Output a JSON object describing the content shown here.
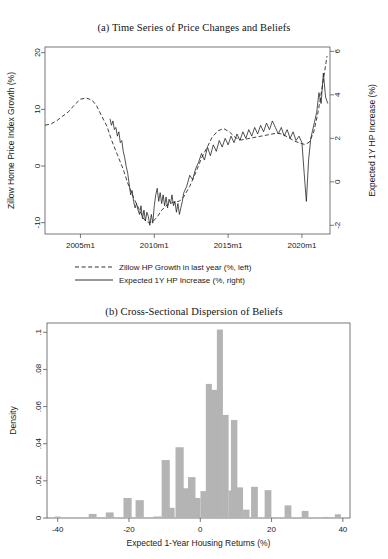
{
  "figure": {
    "background": "#ffffff",
    "panels": [
      "panel-a",
      "panel-b"
    ]
  },
  "panel_a": {
    "title_prefix": "(a)",
    "title": "(a) Time Series of Price Changes and Beliefs",
    "title_text": "Time Series of Price Changes and Beliefs",
    "left_axis_label": "Zillow Home Price Index Growth (%)",
    "right_axis_label": "Expected 1Y HP Increase (%)",
    "left_ticks": [
      "20",
      "10",
      "0",
      "-10"
    ],
    "right_ticks": [
      "6",
      "4",
      "2",
      "0",
      "-2"
    ],
    "x_ticks": [
      "2005m1",
      "2010m1",
      "2015m1",
      "2020m1"
    ],
    "legend": [
      {
        "label": "Zillow HP Growth in last year (%, left)",
        "style": "dashed"
      },
      {
        "label": "Expected 1Y HP Increase (%, right)",
        "style": "solid"
      }
    ]
  },
  "panel_b": {
    "title_prefix": "(b)",
    "title": "(b) Cross-Sectional Dispersion of Beliefs",
    "title_text": "Cross-Sectional Dispersion of Beliefs",
    "y_axis_label": "Density",
    "x_axis_label": "Expected 1-Year Housing Returns (%)",
    "y_ticks": [
      ".1",
      ".08",
      ".06",
      ".04",
      ".02",
      "0"
    ],
    "x_ticks": [
      "-40",
      "-20",
      "0",
      "20",
      "40"
    ]
  },
  "colors": {
    "bar_fill": "#b4b4b4",
    "axis": "#555555",
    "line": "#1a1a1a",
    "text": "#1a1a1a",
    "background": "#ffffff"
  },
  "chart_data": [
    {
      "id": "panel-a",
      "type": "line",
      "title": "(a) Time Series of Price Changes and Beliefs",
      "xlabel": "",
      "ylabel": "Zillow Home Price Index Growth (%)",
      "y2label": "Expected 1Y HP Increase (%)",
      "xlim": [
        2002.6,
        2021.9
      ],
      "ylim": [
        -12.0,
        21.0
      ],
      "y2lim": [
        -2.4,
        6.2
      ],
      "yticks": [
        20,
        10,
        0,
        -10
      ],
      "y2ticks": [
        6,
        4,
        2,
        0,
        -2
      ],
      "xticks": [
        2005,
        2010,
        2015,
        2020
      ],
      "xticklabels": [
        "2005m1",
        "2010m1",
        "2015m1",
        "2020m1"
      ],
      "grid": false,
      "legend_position": "below",
      "series": [
        {
          "name": "Zillow HP Growth in last year (%, left)",
          "style": "dashed",
          "axis": "left",
          "x": [
            2002.6,
            2003.0,
            2003.4,
            2003.8,
            2004.2,
            2004.6,
            2005.0,
            2005.4,
            2005.8,
            2006.1,
            2006.4,
            2006.8,
            2007.1,
            2007.5,
            2007.9,
            2008.2,
            2008.6,
            2009.0,
            2009.3,
            2009.6,
            2009.9,
            2010.2,
            2010.5,
            2010.9,
            2011.3,
            2011.7,
            2012.0,
            2012.4,
            2012.8,
            2013.2,
            2013.6,
            2013.9,
            2014.3,
            2014.7,
            2015.1,
            2015.5,
            2015.9,
            2016.3,
            2016.7,
            2017.1,
            2017.5,
            2017.9,
            2018.3,
            2018.7,
            2019.1,
            2019.5,
            2019.9,
            2020.2,
            2020.5,
            2020.8,
            2021.1,
            2021.4,
            2021.7
          ],
          "y": [
            7.2,
            7.4,
            8.0,
            8.8,
            9.6,
            10.8,
            11.8,
            12.0,
            11.6,
            10.6,
            9.0,
            7.0,
            4.6,
            2.0,
            -0.6,
            -3.0,
            -5.6,
            -7.8,
            -9.4,
            -10.0,
            -9.8,
            -9.0,
            -7.8,
            -6.8,
            -6.4,
            -6.2,
            -5.4,
            -3.6,
            -1.2,
            1.4,
            3.4,
            5.0,
            6.2,
            6.6,
            6.0,
            5.0,
            4.6,
            4.8,
            5.0,
            5.2,
            5.4,
            5.6,
            5.8,
            5.6,
            5.0,
            4.4,
            4.0,
            3.8,
            4.2,
            6.0,
            9.6,
            14.4,
            19.4
          ]
        },
        {
          "name": "Expected 1Y HP Increase (%, right)",
          "style": "solid",
          "axis": "right",
          "x": [
            2007.0,
            2007.1,
            2007.2,
            2007.3,
            2007.4,
            2007.5,
            2007.6,
            2007.7,
            2007.8,
            2007.9,
            2008.0,
            2008.1,
            2008.2,
            2008.3,
            2008.4,
            2008.5,
            2008.6,
            2008.7,
            2008.8,
            2008.9,
            2009.0,
            2009.1,
            2009.2,
            2009.3,
            2009.4,
            2009.5,
            2009.6,
            2009.7,
            2009.8,
            2009.9,
            2010.0,
            2010.1,
            2010.2,
            2010.3,
            2010.4,
            2010.5,
            2010.6,
            2010.7,
            2010.8,
            2010.9,
            2011.0,
            2011.1,
            2011.2,
            2011.3,
            2011.4,
            2011.5,
            2011.6,
            2011.7,
            2011.8,
            2011.9,
            2012.0,
            2012.2,
            2012.4,
            2012.6,
            2012.8,
            2013.0,
            2013.2,
            2013.4,
            2013.6,
            2013.8,
            2014.0,
            2014.2,
            2014.4,
            2014.6,
            2014.8,
            2015.0,
            2015.2,
            2015.4,
            2015.6,
            2015.8,
            2016.0,
            2016.2,
            2016.4,
            2016.6,
            2016.8,
            2017.0,
            2017.2,
            2017.4,
            2017.6,
            2017.8,
            2018.0,
            2018.2,
            2018.4,
            2018.6,
            2018.8,
            2019.0,
            2019.2,
            2019.4,
            2019.6,
            2019.8,
            2020.0,
            2020.15,
            2020.3,
            2020.45,
            2020.6,
            2020.8,
            2021.0,
            2021.15,
            2021.3,
            2021.45,
            2021.6,
            2021.75
          ],
          "y": [
            2.9,
            2.6,
            2.8,
            2.4,
            2.5,
            2.1,
            2.3,
            1.8,
            1.9,
            1.4,
            1.1,
            0.7,
            0.4,
            -0.1,
            -0.6,
            -0.4,
            -0.9,
            -1.2,
            -1.0,
            -1.3,
            -1.5,
            -1.1,
            -1.7,
            -1.3,
            -1.8,
            -1.4,
            -1.6,
            -2.0,
            -1.5,
            -1.9,
            -1.1,
            -0.6,
            -0.3,
            -0.9,
            -0.5,
            -1.0,
            -0.6,
            -1.1,
            -0.7,
            -1.2,
            -0.8,
            -1.0,
            -0.6,
            -1.1,
            -0.9,
            -1.4,
            -1.0,
            -1.5,
            -1.2,
            -0.9,
            -0.5,
            -0.2,
            0.3,
            0.1,
            0.6,
            0.9,
            1.3,
            1.0,
            1.6,
            1.2,
            1.7,
            1.4,
            1.9,
            1.6,
            2.0,
            1.7,
            2.1,
            1.8,
            2.2,
            1.9,
            2.3,
            2.0,
            2.4,
            2.1,
            2.5,
            2.2,
            2.6,
            2.3,
            2.7,
            2.4,
            2.8,
            2.5,
            2.2,
            2.5,
            2.1,
            2.4,
            2.0,
            2.3,
            1.9,
            2.1,
            1.8,
            0.4,
            -0.9,
            1.0,
            2.0,
            2.6,
            3.2,
            4.1,
            3.6,
            5.0,
            3.9,
            3.6
          ]
        }
      ]
    },
    {
      "id": "panel-b",
      "type": "bar",
      "subtype": "histogram",
      "title": "(b) Cross-Sectional Dispersion of Beliefs",
      "xlabel": "Expected 1-Year Housing Returns (%)",
      "ylabel": "Density",
      "xlim": [
        -43,
        42
      ],
      "ylim": [
        0,
        0.105
      ],
      "xticks": [
        -40,
        -20,
        0,
        20,
        40
      ],
      "yticks": [
        0,
        0.02,
        0.04,
        0.06,
        0.08,
        0.1
      ],
      "yticklabels": [
        "0",
        ".02",
        ".04",
        ".06",
        ".08",
        ".1"
      ],
      "grid": false,
      "bin_width": 2.5,
      "bin_centers": [
        -40,
        -30,
        -25,
        -20,
        -17.5,
        -12.5,
        -10,
        -8.75,
        -7.5,
        -6.25,
        -5,
        -3.75,
        -2.5,
        -1.25,
        0,
        1.25,
        2.5,
        3.75,
        5,
        6.25,
        7.5,
        8.75,
        10,
        11.25,
        15,
        17.5,
        20,
        25,
        30,
        35,
        39
      ],
      "bin_values": [
        0.0008,
        0.0022,
        0.003,
        0.0002,
        0.0108,
        0.0096,
        0.0008,
        0.0312,
        0.0055,
        0.0381,
        0.016,
        0.022,
        0.0145,
        0.0108,
        0.0722,
        0.069,
        0.058,
        0.1015,
        0.0555,
        0.0148,
        0.0528,
        0.0165,
        0.0045,
        0.0006,
        0.0168,
        0.015,
        0.0012,
        0.0068,
        0.0038,
        0.0006,
        0.002
      ],
      "bars": [
        {
          "x": -40.0,
          "w": 1.6,
          "v": 0.0008
        },
        {
          "x": -30.2,
          "w": 2.2,
          "v": 0.0022
        },
        {
          "x": -25.4,
          "w": 2.2,
          "v": 0.003
        },
        {
          "x": -20.4,
          "w": 2.3,
          "v": 0.0108
        },
        {
          "x": -17.0,
          "w": 2.3,
          "v": 0.0096
        },
        {
          "x": -12.0,
          "w": 2.3,
          "v": 0.0008
        },
        {
          "x": -9.7,
          "w": 2.3,
          "v": 0.0312
        },
        {
          "x": -8.0,
          "w": 1.6,
          "v": 0.0055
        },
        {
          "x": -5.8,
          "w": 2.3,
          "v": 0.0381
        },
        {
          "x": -4.0,
          "w": 1.7,
          "v": 0.016
        },
        {
          "x": -2.4,
          "w": 2.1,
          "v": 0.022
        },
        {
          "x": -0.8,
          "w": 1.7,
          "v": 0.0108
        },
        {
          "x": 0.9,
          "w": 1.7,
          "v": 0.0145
        },
        {
          "x": 2.4,
          "w": 1.7,
          "v": 0.0722
        },
        {
          "x": 3.9,
          "w": 1.7,
          "v": 0.069
        },
        {
          "x": 5.5,
          "w": 1.7,
          "v": 0.1015
        },
        {
          "x": 7.1,
          "w": 1.7,
          "v": 0.0555
        },
        {
          "x": 8.7,
          "w": 1.6,
          "v": 0.0148
        },
        {
          "x": 9.5,
          "w": 1.8,
          "v": 0.0528
        },
        {
          "x": 11.1,
          "w": 1.8,
          "v": 0.0165
        },
        {
          "x": 12.9,
          "w": 1.8,
          "v": 0.0045
        },
        {
          "x": 15.2,
          "w": 1.9,
          "v": 0.0168
        },
        {
          "x": 19.0,
          "w": 1.9,
          "v": 0.015
        },
        {
          "x": 24.6,
          "w": 1.9,
          "v": 0.0068
        },
        {
          "x": 29.4,
          "w": 1.9,
          "v": 0.0038
        },
        {
          "x": 35.2,
          "w": 1.7,
          "v": 0.0006
        },
        {
          "x": 38.6,
          "w": 1.7,
          "v": 0.002
        }
      ]
    }
  ]
}
